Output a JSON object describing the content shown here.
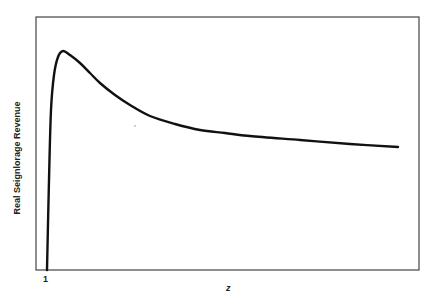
{
  "chart_data": {
    "type": "line",
    "title": "",
    "xlabel": "z",
    "ylabel": "Real Seignlorage Revenue",
    "x_tick_labels": [
      "1"
    ],
    "y_tick_labels": [],
    "grid": false,
    "legend": null,
    "series": [
      {
        "name": "Real Seignlorage Revenue",
        "points_px": [
          [
            47,
            270
          ],
          [
            49,
            180
          ],
          [
            51,
            110
          ],
          [
            54,
            75
          ],
          [
            58,
            57
          ],
          [
            63,
            51
          ],
          [
            70,
            55
          ],
          [
            80,
            63
          ],
          [
            90,
            73
          ],
          [
            100,
            83
          ],
          [
            115,
            95
          ],
          [
            130,
            105
          ],
          [
            150,
            116
          ],
          [
            175,
            124
          ],
          [
            200,
            130
          ],
          [
            225,
            133
          ],
          [
            250,
            136
          ],
          [
            300,
            140
          ],
          [
            350,
            144
          ],
          [
            398,
            147
          ]
        ]
      }
    ],
    "plot_box_px": {
      "left": 36,
      "top": 17,
      "right": 419,
      "bottom": 270
    }
  }
}
